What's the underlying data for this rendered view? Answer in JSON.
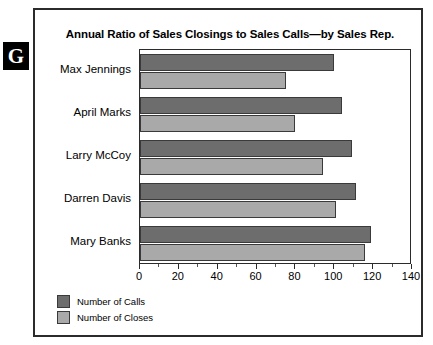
{
  "marker": {
    "letter": "G"
  },
  "chart_data": {
    "type": "bar",
    "orientation": "horizontal",
    "title": "Annual Ratio of Sales Closings to Sales Calls—by Sales Rep.",
    "xlabel": "",
    "ylabel": "",
    "xlim": [
      0,
      140
    ],
    "xticks": [
      0,
      20,
      40,
      60,
      80,
      100,
      120,
      140
    ],
    "xtick_labels": [
      "0",
      "20",
      "40",
      "60",
      "80",
      "100",
      "120",
      "140"
    ],
    "grid": false,
    "legend_position": "bottom-left",
    "categories": [
      "Max Jennings",
      "April Marks",
      "Larry McCoy",
      "Darren Davis",
      "Mary Banks"
    ],
    "series": [
      {
        "name": "Number of Calls",
        "color": "#6d6d6d",
        "values": [
          100,
          104,
          109,
          111,
          119
        ]
      },
      {
        "name": "Number of Closes",
        "color": "#a9a9a9",
        "values": [
          75,
          80,
          94,
          101,
          116
        ]
      }
    ]
  }
}
